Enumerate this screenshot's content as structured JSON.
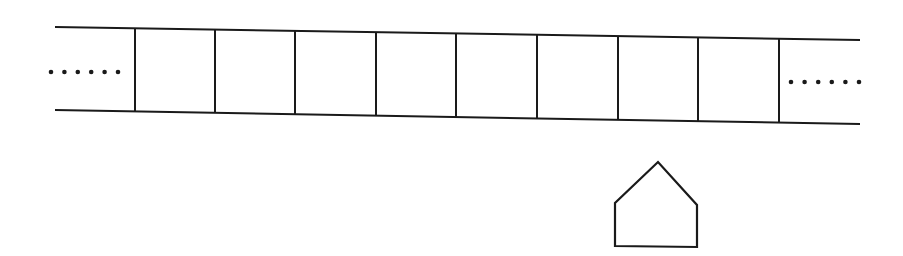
{
  "diagram": {
    "type": "tape-with-head",
    "stroke_color": "#1a1a1a",
    "background": "#ffffff",
    "tape": {
      "top_line": {
        "x1": 55,
        "y1": 27,
        "x2": 860,
        "y2": 40
      },
      "bottom_line": {
        "x1": 55,
        "y1": 110,
        "x2": 860,
        "y2": 124
      },
      "cell_boundaries_x": [
        135,
        215,
        295,
        376,
        456,
        537,
        618,
        698,
        779
      ],
      "cell_count": 8,
      "left_ellipsis": {
        "dots": 6,
        "x_start": 51,
        "x_end": 118,
        "y": 72
      },
      "right_ellipsis": {
        "dots": 6,
        "x_start": 791,
        "x_end": 859,
        "y": 82
      }
    },
    "head": {
      "shape": "pentagon-house",
      "points": [
        [
          615,
          246
        ],
        [
          615,
          203
        ],
        [
          658,
          162
        ],
        [
          697,
          205
        ],
        [
          697,
          247
        ]
      ]
    }
  }
}
